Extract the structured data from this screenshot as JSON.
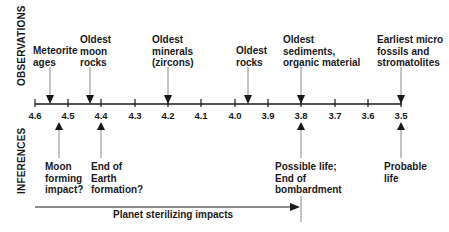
{
  "section_labels": {
    "observations": "OBSERVATIONS",
    "inferences": "INFERENCES"
  },
  "axis": {
    "unit_note": "Billions of years ago (implied)",
    "ticks": [
      "4.6",
      "4.5",
      "4.4",
      "4.3",
      "4.2",
      "4.1",
      "4.0",
      "3.9",
      "3.8",
      "3.7",
      "3.6",
      "3.5"
    ]
  },
  "observations": [
    {
      "line1": "Meteorite",
      "line2": "ages",
      "line3": "",
      "at": 4.555
    },
    {
      "line1": "Oldest",
      "line2": "moon",
      "line3": "rocks",
      "at": 4.435
    },
    {
      "line1": "Oldest",
      "line2": "minerals",
      "line3": "(zircons)",
      "at": 4.2
    },
    {
      "line1": "Oldest",
      "line2": "rocks",
      "line3": "",
      "at": 3.96
    },
    {
      "line1": "Oldest",
      "line2": "sediments,",
      "line3": "organic material",
      "at": 3.8
    },
    {
      "line1": "Earliest micro",
      "line2": "fossils and",
      "line3": "stromatolites",
      "at": 3.5
    }
  ],
  "inferences": [
    {
      "line1": "Moon",
      "line2": "forming",
      "line3": "impact?",
      "at": 4.53
    },
    {
      "line1": "End of",
      "line2": "Earth",
      "line3": "formation?",
      "at": 4.4
    },
    {
      "line1": "Possible life;",
      "line2": "End of",
      "line3": "bombardment",
      "at": 3.8
    },
    {
      "line1": "Probable",
      "line2": "life",
      "line3": "",
      "at": 3.5
    }
  ],
  "span": {
    "label": "Planet sterilizing impacts",
    "from": 4.6,
    "to": 3.8
  },
  "colors": {
    "ink": "#1a1a1a",
    "arrow_shaft": "#888888"
  }
}
